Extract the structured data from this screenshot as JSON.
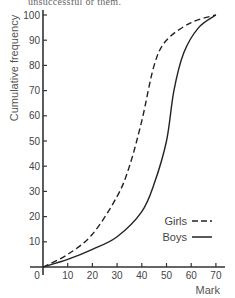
{
  "header": {
    "cut_text": "unsuccessful or them."
  },
  "chart_data": {
    "type": "line",
    "title": "",
    "xlabel": "Mark",
    "ylabel": "Cumulative frequency",
    "xlim": [
      0,
      70
    ],
    "ylim": [
      0,
      100
    ],
    "x_ticks": [
      0,
      10,
      20,
      30,
      40,
      50,
      60,
      70
    ],
    "y_ticks": [
      10,
      20,
      30,
      40,
      50,
      60,
      70,
      80,
      90,
      100
    ],
    "grid": false,
    "legend_position": "lower right, inside",
    "series": [
      {
        "name": "Girls",
        "style": "dashed",
        "color": "#222222",
        "x": [
          0,
          10,
          20,
          30,
          35,
          40,
          45,
          50,
          60,
          70
        ],
        "y": [
          0,
          5,
          13,
          28,
          40,
          58,
          80,
          90,
          97,
          100
        ]
      },
      {
        "name": "Boys",
        "style": "solid",
        "color": "#222222",
        "x": [
          0,
          10,
          20,
          30,
          40,
          45,
          50,
          53,
          57,
          63,
          70
        ],
        "y": [
          0,
          3,
          7,
          12,
          22,
          33,
          50,
          70,
          85,
          95,
          100
        ]
      }
    ]
  }
}
